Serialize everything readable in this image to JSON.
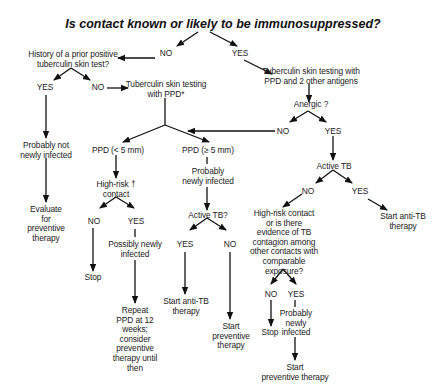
{
  "diagram": {
    "title": "Is contact known or likely to be immunosuppressed?",
    "nodes": {
      "root_no": "NO",
      "root_yes": "YES",
      "history_q": [
        "History of a prior positive",
        "tuberculin skin test?"
      ],
      "history_yes": "YES",
      "history_no": "NO",
      "ppd_test": [
        "Tuberculin skin testing",
        "with PPD*"
      ],
      "ppd_2ag": [
        "Tuberculin skin testing with",
        "PPD and 2 other antigens"
      ],
      "anergic_q": "Anergic ?",
      "anergic_no": "NO",
      "anergic_yes": "YES",
      "not_infected": [
        "Probably not",
        "newly infected"
      ],
      "evaluate": [
        "Evaluate",
        "for",
        "preventive",
        "therapy"
      ],
      "ppd_lt5": "PPD (< 5 mm)",
      "ppd_ge5": "PPD (≥ 5 mm)",
      "highrisk_q": [
        "High-risk †",
        "contact"
      ],
      "highrisk_no": "NO",
      "highrisk_yes": "YES",
      "stop1": "Stop",
      "possibly_infected": [
        "Possibly newly",
        "infected"
      ],
      "repeat_ppd": [
        "Repeat",
        "PPD at 12",
        "weeks;",
        "consider",
        "preventive",
        "therapy until",
        "then"
      ],
      "probably_infected_mid": [
        "Probably",
        "newly infected"
      ],
      "active_tb_q_mid": "Active TB?",
      "mid_yes": "YES",
      "mid_no": "NO",
      "start_antitb_mid": [
        "Start anti-TB",
        "therapy"
      ],
      "start_prev_mid": [
        "Start",
        "preventive",
        "therapy"
      ],
      "active_tb_right": "Active TB",
      "right_no": "NO",
      "right_yes": "YES",
      "start_antitb_right": [
        "Start anti-TB",
        "therapy"
      ],
      "contagion_q": [
        "High-risk contact",
        "or is there",
        "evidence of TB",
        "contagion among",
        "other contacts with",
        "comparable",
        "exposure?"
      ],
      "contagion_no": "NO",
      "contagion_yes": "YES",
      "stop2": "Stop",
      "probably_infected_right": [
        "Probably",
        "newly",
        "infected"
      ],
      "start_prev_right": [
        "Start",
        "preventive therapy"
      ]
    }
  }
}
